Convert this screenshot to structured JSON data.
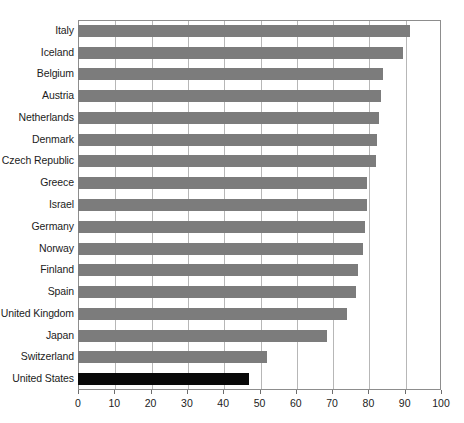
{
  "chart_data": {
    "type": "bar",
    "orientation": "horizontal",
    "title": "",
    "subtitle": "",
    "xlabel": "",
    "ylabel": "",
    "xlim": [
      0,
      100
    ],
    "xticks": [
      0,
      10,
      20,
      30,
      40,
      50,
      60,
      70,
      80,
      90,
      100
    ],
    "grid": true,
    "grid_axis": "x",
    "legend": false,
    "categories": [
      "Italy",
      "Iceland",
      "Belgium",
      "Austria",
      "Netherlands",
      "Denmark",
      "Czech Republic",
      "Greece",
      "Israel",
      "Germany",
      "Norway",
      "Finland",
      "Spain",
      "United Kingdom",
      "Japan",
      "Switzerland",
      "United States"
    ],
    "values": [
      91.5,
      89.5,
      84,
      83.5,
      83,
      82.5,
      82,
      79.5,
      79.5,
      79,
      78.5,
      77,
      76.5,
      74,
      68.5,
      52,
      47
    ],
    "bar_color": "#7c7c7c",
    "highlight_color": "#090909",
    "highlight_category": "United States",
    "axis_color": "#8d8d8d",
    "gridline_color": "#b7b7b7"
  },
  "footnote": ""
}
